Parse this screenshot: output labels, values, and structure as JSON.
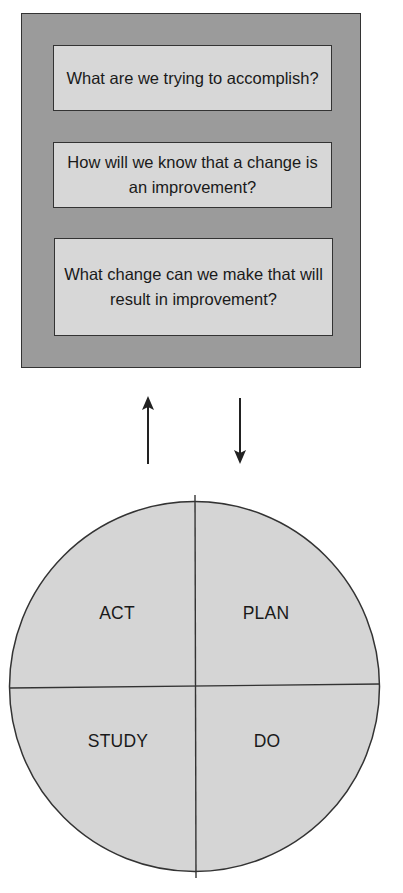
{
  "model_for_improvement": {
    "questions": [
      "What are we trying to accomplish?",
      "How will we know that a change is an improvement?",
      "What change can we make that will result in improvement?"
    ],
    "arrows": [
      {
        "direction": "up",
        "icon": "arrow-up-icon"
      },
      {
        "direction": "down",
        "icon": "arrow-down-icon"
      }
    ]
  },
  "pdsa_cycle": {
    "quadrants": {
      "top_left": "ACT",
      "top_right": "PLAN",
      "bottom_left": "STUDY",
      "bottom_right": "DO"
    }
  },
  "colors": {
    "outer_box_fill": "#9b9b9b",
    "question_box_fill": "#d7d7d7",
    "circle_fill": "#d5d5d5",
    "line_color": "#333333"
  }
}
